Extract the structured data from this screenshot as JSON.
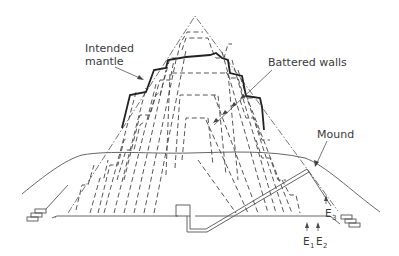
{
  "figure": {
    "labels": {
      "intended_mantle_line1": "Intended",
      "intended_mantle_line2": "mantle",
      "battered_walls": "Battered walls",
      "mound": "Mound",
      "e1_main": "E",
      "e1_sub": "1",
      "e2_main": "E",
      "e2_sub": "2",
      "e3_main": "E",
      "e3_sub": "3"
    },
    "line_styles": {
      "intended_mantle": "dash-dot",
      "battered_walls": "dashed",
      "surviving_outline": "thick solid",
      "mound": "thin solid",
      "passage": "double thin solid"
    },
    "colors": {
      "background": "#ffffff",
      "line": "#444444",
      "text": "#3a3a3a"
    }
  }
}
